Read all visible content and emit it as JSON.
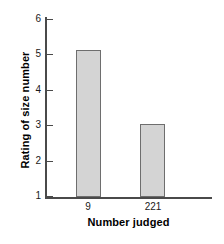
{
  "chart_data": {
    "type": "bar",
    "title": "",
    "subtitle": "",
    "xlabel": "Number judged",
    "ylabel": "Rating of size number",
    "categories": [
      "9",
      "221"
    ],
    "values": [
      5.13,
      3.05
    ],
    "series": [
      {
        "name": "Rating of size number",
        "values": [
          5.13,
          3.05
        ]
      }
    ],
    "ylim": [
      1,
      6
    ],
    "yticks": [
      1,
      2,
      3,
      4,
      5,
      6
    ],
    "ytick_labels": [
      "1",
      "2",
      "3",
      "4",
      "5",
      "6"
    ],
    "xtick_labels": [
      "9",
      "221"
    ],
    "grid": false,
    "legend": false,
    "legend_position": "none",
    "bar_fill_color": "#d4d4d4",
    "bar_edge_color": "#6e6e6e",
    "axis_color": "#4a4a4a",
    "text_color": "#1a1a1a",
    "background_color": "#ffffff"
  }
}
